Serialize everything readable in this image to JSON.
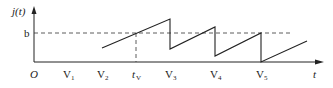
{
  "diagram": {
    "y_axis_label": "j(t)",
    "x_axis_label": "t",
    "origin_label": "O",
    "level_label": "b",
    "tick_labels": [
      {
        "main": "V",
        "sub": "1",
        "x": 68
      },
      {
        "main": "V",
        "sub": "2",
        "x": 102
      },
      {
        "main": "t",
        "sub": "V",
        "x": 136
      },
      {
        "main": "V",
        "sub": "3",
        "x": 170
      },
      {
        "main": "V",
        "sub": "4",
        "x": 215
      },
      {
        "main": "V",
        "sub": "5",
        "x": 261
      }
    ],
    "colors": {
      "line": "#222222",
      "dash": "#333333",
      "axis": "#222222"
    }
  }
}
